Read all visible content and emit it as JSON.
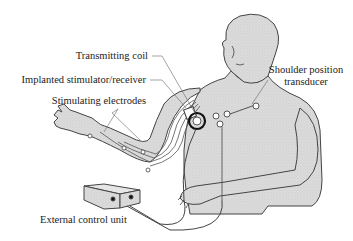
{
  "diagram": {
    "labels": {
      "transmitting_coil": "Transmitting coil",
      "implanted_stimulator": "Implanted stimulator/receiver",
      "stimulating_electrodes": "Stimulating electrodes",
      "shoulder_transducer_line1": "Shoulder position",
      "shoulder_transducer_line2": "transducer",
      "external_control_unit": "External control unit"
    },
    "colors": {
      "body_fill": "#d9d9d9",
      "outline": "#444444",
      "label": "#222222"
    }
  }
}
